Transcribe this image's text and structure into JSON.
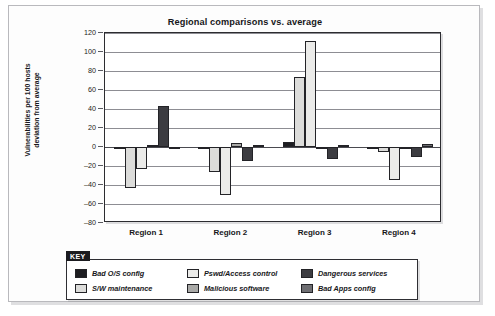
{
  "chart_data": {
    "type": "bar",
    "title": "Regional comparisons vs. average",
    "xlabel": "",
    "ylabel": "Vulnerabilities per 100 hosts\ndeviation from average",
    "ylim": [
      -80,
      120
    ],
    "ytick_step": 20,
    "yticks": [
      "120",
      "100",
      "80",
      "60",
      "40",
      "20",
      "0",
      "–20",
      "–40",
      "–60",
      "–80"
    ],
    "grid": true,
    "legend_position": "below-chart",
    "legend_title": "KEY",
    "categories": [
      "Region 1",
      "Region 2",
      "Region 3",
      "Region 4"
    ],
    "series": [
      {
        "name": "Bad O/S config",
        "color": "#1d1d21",
        "values": [
          -1,
          -1,
          5,
          -1
        ]
      },
      {
        "name": "S/W maintenance",
        "color": "#dcdcda",
        "values": [
          -43,
          -26,
          74,
          -5
        ]
      },
      {
        "name": "Pswd/Access control",
        "color": "#ebebe9",
        "values": [
          -23,
          -51,
          112,
          -35
        ]
      },
      {
        "name": "Malicious software",
        "color": "#a9a9a7",
        "values": [
          0,
          4,
          -1,
          -1
        ]
      },
      {
        "name": "Dangerous services",
        "color": "#3c3c41",
        "values": [
          43,
          -15,
          -13,
          -10
        ]
      },
      {
        "name": "Bad Apps config",
        "color": "#6e6e72",
        "values": [
          -2,
          0,
          0,
          3
        ]
      }
    ]
  },
  "legend": {
    "title": "KEY",
    "entries": [
      {
        "label": "Bad O/S config",
        "color": "#1d1d21"
      },
      {
        "label": "Pswd/Access control",
        "color": "#ebebe9"
      },
      {
        "label": "Dangerous services",
        "color": "#3c3c41"
      },
      {
        "label": "S/W maintenance",
        "color": "#dcdcda"
      },
      {
        "label": "Malicious software",
        "color": "#a9a9a7"
      },
      {
        "label": "Bad Apps config",
        "color": "#6e6e72"
      }
    ]
  }
}
